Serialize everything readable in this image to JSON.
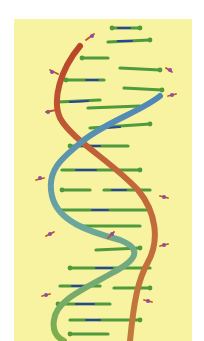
{
  "image": {
    "subject": "DNA double helix molecular model",
    "background_color": "#ffffff",
    "panel_color": "#f8f3a0",
    "strand_colors": {
      "strand_a_top": "#b8452a",
      "strand_a_bottom": "#c27a3c",
      "strand_b_top": "#4f86b8",
      "strand_b_middle": "#6aa6a0",
      "strand_b_bottom": "#7fae4a"
    },
    "base_pair_colors": {
      "carbon": "#4f9a3c",
      "nitrogen": "#2f3fa8",
      "oxygen": "#c8502a",
      "phosphorus": "#8a4fa0"
    }
  }
}
